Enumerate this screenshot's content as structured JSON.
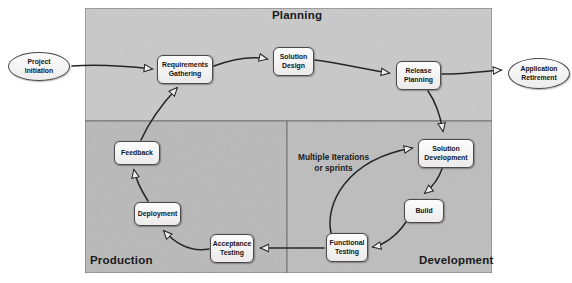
{
  "diagram": {
    "title_alt": "Application lifecycle flow",
    "panels": [
      {
        "name": "planning",
        "label": "Planning",
        "x": 85,
        "y": 8,
        "w": 407,
        "h": 113,
        "fill": "#c9c9c9",
        "title_x": 272,
        "title_y": 9,
        "title_size": 11.5
      },
      {
        "name": "production",
        "label": "Production",
        "x": 85,
        "y": 121,
        "w": 202,
        "h": 152,
        "fill": "#b9b9b9",
        "title_x": 90,
        "title_y": 254,
        "title_size": 11.5
      },
      {
        "name": "development",
        "label": "Development",
        "x": 287,
        "y": 121,
        "w": 205,
        "h": 152,
        "fill": "#bdbdbd",
        "title_x": 419,
        "title_y": 254,
        "title_size": 11.5
      }
    ],
    "terminators": [
      {
        "name": "project-initiation",
        "label": "Project\nInitiation",
        "x": 8,
        "y": 52,
        "w": 62,
        "h": 29
      },
      {
        "name": "application-retirement",
        "label": "Application\nRetirement",
        "x": 508,
        "y": 58,
        "w": 62,
        "h": 31
      }
    ],
    "nodes": [
      {
        "name": "requirements-gathering",
        "label": "Requirements\nGathering",
        "x": 157,
        "y": 55,
        "w": 56,
        "h": 29
      },
      {
        "name": "solution-design",
        "label": "Solution\nDesign",
        "x": 273,
        "y": 47,
        "w": 41,
        "h": 29
      },
      {
        "name": "release-planning",
        "label": "Release\nPlanning",
        "x": 396,
        "y": 61,
        "w": 45,
        "h": 29
      },
      {
        "name": "solution-development",
        "label": "Solution\nDevelopment",
        "x": 418,
        "y": 139,
        "w": 56,
        "h": 29
      },
      {
        "name": "build",
        "label": "Build",
        "x": 404,
        "y": 199,
        "w": 40,
        "h": 24
      },
      {
        "name": "functional-testing",
        "label": "Functional\nTesting",
        "x": 326,
        "y": 233,
        "w": 42,
        "h": 29
      },
      {
        "name": "acceptance-testing",
        "label": "Acceptance\nTesting",
        "x": 210,
        "y": 234,
        "w": 44,
        "h": 29
      },
      {
        "name": "deployment",
        "label": "Deployment",
        "x": 134,
        "y": 202,
        "w": 47,
        "h": 24
      },
      {
        "name": "feedback",
        "label": "Feedback",
        "x": 114,
        "y": 141,
        "w": 46,
        "h": 24
      }
    ],
    "annotations": [
      {
        "name": "iterations-note",
        "label": "Multiple Iterations\nor sprints",
        "x": 298,
        "y": 152
      }
    ],
    "edges": [
      {
        "name": "edge-initiation-to-requirements",
        "from": "project-initiation",
        "to": "requirements-gathering"
      },
      {
        "name": "edge-requirements-to-design",
        "from": "requirements-gathering",
        "to": "solution-design"
      },
      {
        "name": "edge-design-to-release",
        "from": "solution-design",
        "to": "release-planning"
      },
      {
        "name": "edge-release-to-retirement",
        "from": "release-planning",
        "to": "application-retirement"
      },
      {
        "name": "edge-release-to-solution-development",
        "from": "release-planning",
        "to": "solution-development"
      },
      {
        "name": "edge-solution-development-to-build",
        "from": "solution-development",
        "to": "build"
      },
      {
        "name": "edge-build-to-functional-testing",
        "from": "build",
        "to": "functional-testing"
      },
      {
        "name": "edge-functional-testing-to-solution-development",
        "from": "functional-testing",
        "to": "solution-development"
      },
      {
        "name": "edge-functional-to-acceptance-testing",
        "from": "functional-testing",
        "to": "acceptance-testing"
      },
      {
        "name": "edge-acceptance-to-deployment",
        "from": "acceptance-testing",
        "to": "deployment"
      },
      {
        "name": "edge-deployment-to-feedback",
        "from": "deployment",
        "to": "feedback"
      },
      {
        "name": "edge-feedback-to-requirements",
        "from": "feedback",
        "to": "requirements-gathering"
      }
    ],
    "colors": {
      "planning_fill": "#c9c9c9",
      "production_fill": "#b9b9b9",
      "development_fill": "#bdbdbd",
      "panel_border": "#6d6d6d",
      "node_stroke": "#4a4a4a",
      "arrow_stroke": "#262626",
      "text": "#141414"
    }
  }
}
